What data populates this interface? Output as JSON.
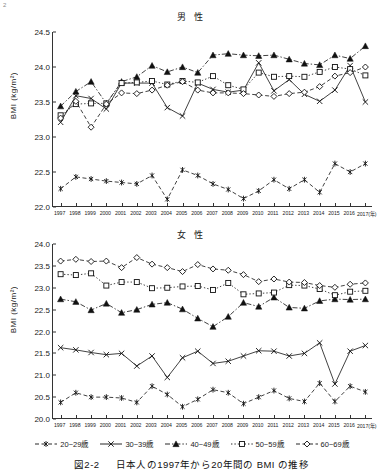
{
  "corner_mark": "2",
  "caption": {
    "number": "図2-2",
    "text": "日本人の1997年から20年間の BMI の推移"
  },
  "axis": {
    "ylabel": "BMI (kg/m²)",
    "x_unit_suffix": "(年)"
  },
  "legend": {
    "items": [
      {
        "label": "20~29歳",
        "marker": "asterisk",
        "line": "dashed"
      },
      {
        "label": "30~39歳",
        "marker": "cross",
        "line": "solid"
      },
      {
        "label": "40~49歳",
        "marker": "triangle-filled",
        "line": "dash-dot"
      },
      {
        "label": "50~59歳",
        "marker": "square-open",
        "line": "dotted"
      },
      {
        "label": "60~69歳",
        "marker": "diamond-open",
        "line": "dashed"
      }
    ]
  },
  "chart_data": [
    {
      "type": "line",
      "title": "男 性",
      "panel": "male",
      "xlabel": "",
      "ylabel": "BMI (kg/m²)",
      "ylim": [
        22.0,
        24.5
      ],
      "yticks": [
        "22.0",
        "22.5",
        "23.0",
        "23.5",
        "24.0",
        "24.5"
      ],
      "grid": false,
      "legend_position": "bottom",
      "x": [
        1997,
        1998,
        1999,
        2000,
        2001,
        2002,
        2003,
        2004,
        2005,
        2006,
        2007,
        2008,
        2009,
        2010,
        2011,
        2012,
        2013,
        2014,
        2015,
        2016,
        2017
      ],
      "xticklabels": [
        "1997",
        "1998",
        "1999",
        "2000",
        "2001",
        "2002",
        "2003",
        "2004",
        "2005",
        "2006",
        "2007",
        "2008",
        "2009",
        "2010",
        "2011",
        "2012",
        "2013",
        "2014",
        "2015",
        "2016",
        "2017(年)"
      ],
      "series": [
        {
          "name": "20~29歳",
          "marker": "asterisk",
          "line": "dashed",
          "values": [
            22.26,
            22.43,
            22.4,
            22.37,
            22.35,
            22.33,
            22.45,
            22.11,
            22.53,
            22.45,
            22.33,
            22.25,
            22.12,
            22.23,
            22.39,
            22.26,
            22.39,
            22.21,
            22.62,
            22.5,
            22.62
          ]
        },
        {
          "name": "30~39歳",
          "marker": "cross",
          "line": "solid",
          "values": [
            23.21,
            23.59,
            23.55,
            23.4,
            23.77,
            23.77,
            23.77,
            23.42,
            23.3,
            23.77,
            23.68,
            23.64,
            23.67,
            24.06,
            23.66,
            23.82,
            23.61,
            23.51,
            23.67,
            24.02,
            23.5,
            24.18
          ]
        },
        {
          "name": "40~49歳",
          "marker": "triangle-filled",
          "line": "dash-dot",
          "values": [
            23.44,
            23.65,
            23.79,
            23.48,
            23.79,
            23.86,
            24.02,
            23.93,
            24.0,
            23.92,
            24.17,
            24.19,
            24.17,
            24.16,
            24.17,
            24.11,
            24.05,
            24.03,
            24.17,
            24.12,
            24.3
          ]
        },
        {
          "name": "50~59歳",
          "marker": "square-open",
          "line": "dotted",
          "values": [
            23.31,
            23.47,
            23.48,
            23.48,
            23.77,
            23.78,
            23.8,
            23.75,
            23.8,
            23.78,
            23.87,
            23.74,
            23.68,
            23.92,
            23.86,
            23.87,
            23.86,
            23.93,
            24.0,
            23.97,
            23.88
          ]
        },
        {
          "name": "60~69歳",
          "marker": "diamond-open",
          "line": "dashed",
          "values": [
            23.27,
            23.51,
            23.14,
            23.47,
            23.63,
            23.62,
            23.67,
            23.74,
            23.79,
            23.67,
            23.63,
            23.63,
            23.62,
            23.6,
            23.58,
            23.62,
            23.64,
            23.72,
            23.87,
            23.92,
            24.0
          ]
        }
      ]
    },
    {
      "type": "line",
      "title": "女 性",
      "panel": "female",
      "xlabel": "",
      "ylabel": "BMI (kg/m²)",
      "ylim": [
        20.0,
        24.0
      ],
      "yticks": [
        "20.0",
        "20.5",
        "21.0",
        "21.5",
        "22.0",
        "22.5",
        "23.0",
        "23.5",
        "24.0"
      ],
      "grid": false,
      "legend_position": "bottom",
      "x": [
        1997,
        1998,
        1999,
        2000,
        2001,
        2002,
        2003,
        2004,
        2005,
        2006,
        2007,
        2008,
        2009,
        2010,
        2011,
        2012,
        2013,
        2014,
        2015,
        2016,
        2017
      ],
      "xticklabels": [
        "1997",
        "1998",
        "1999",
        "2000",
        "2001",
        "2002",
        "2003",
        "2004",
        "2005",
        "2006",
        "2007",
        "2008",
        "2009",
        "2010",
        "2011",
        "2012",
        "2013",
        "2014",
        "2015",
        "2016",
        "2017(年)"
      ],
      "series": [
        {
          "name": "20~29歳",
          "marker": "asterisk",
          "line": "dashed",
          "values": [
            20.38,
            20.6,
            20.5,
            20.5,
            20.48,
            20.38,
            20.75,
            20.56,
            20.28,
            20.45,
            20.67,
            20.6,
            20.35,
            20.5,
            20.65,
            20.47,
            20.4,
            20.82,
            20.4,
            20.75,
            20.62
          ]
        },
        {
          "name": "30~39歳",
          "marker": "cross",
          "line": "solid",
          "values": [
            21.63,
            21.58,
            21.52,
            21.47,
            21.5,
            21.21,
            21.44,
            20.95,
            21.4,
            21.55,
            21.27,
            21.32,
            21.44,
            21.56,
            21.55,
            21.44,
            21.5,
            21.74,
            20.8,
            21.55,
            21.68
          ]
        },
        {
          "name": "40~49歳",
          "marker": "triangle-filled",
          "line": "dash-dot",
          "values": [
            22.74,
            22.68,
            22.49,
            22.64,
            22.43,
            22.5,
            22.62,
            22.66,
            22.51,
            22.3,
            22.11,
            22.34,
            22.66,
            22.57,
            22.78,
            22.55,
            22.53,
            22.7,
            22.74,
            22.73,
            22.74
          ]
        },
        {
          "name": "50~59歳",
          "marker": "square-open",
          "line": "dotted",
          "values": [
            23.31,
            23.29,
            23.33,
            23.05,
            23.13,
            23.13,
            22.99,
            23.0,
            23.03,
            23.04,
            22.95,
            23.11,
            22.85,
            22.87,
            22.89,
            23.06,
            23.05,
            22.97,
            22.83,
            22.91,
            22.93
          ]
        },
        {
          "name": "60~69歳",
          "marker": "diamond-open",
          "line": "dashed",
          "values": [
            23.61,
            23.65,
            23.6,
            23.61,
            23.46,
            23.69,
            23.54,
            23.46,
            23.37,
            23.53,
            23.43,
            23.4,
            23.3,
            23.14,
            23.2,
            23.13,
            23.12,
            23.05,
            23.01,
            23.08,
            23.11
          ]
        }
      ]
    }
  ]
}
